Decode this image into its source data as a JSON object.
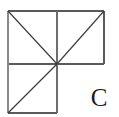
{
  "figure": {
    "label": "C",
    "background_color": "#ffffff",
    "stroke_color": "#5a5a5a",
    "label_color": "#1a1a1a",
    "stroke_width": 1,
    "geometry": {
      "outer_left": 8,
      "outer_top": 11,
      "outer_right": 104,
      "outer_bottom": 113,
      "mid_x": 57,
      "mid_y": 64,
      "cell_size": 49
    },
    "segments": [
      {
        "name": "top-edge",
        "x1": 8,
        "y1": 11,
        "x2": 104,
        "y2": 11
      },
      {
        "name": "middle-horizontal-edge",
        "x1": 8,
        "y1": 64,
        "x2": 104,
        "y2": 64
      },
      {
        "name": "bottom-edge",
        "x1": 8,
        "y1": 113,
        "x2": 57,
        "y2": 113
      },
      {
        "name": "left-edge",
        "x1": 8,
        "y1": 11,
        "x2": 8,
        "y2": 113
      },
      {
        "name": "middle-vertical-edge",
        "x1": 57,
        "y1": 11,
        "x2": 57,
        "y2": 113
      },
      {
        "name": "right-edge",
        "x1": 104,
        "y1": 11,
        "x2": 104,
        "y2": 64
      },
      {
        "name": "diagonal-top-left-square",
        "x1": 8,
        "y1": 11,
        "x2": 57,
        "y2": 64
      },
      {
        "name": "diagonal-top-right-square",
        "x1": 57,
        "y1": 64,
        "x2": 104,
        "y2": 11
      },
      {
        "name": "diagonal-bottom-left-square",
        "x1": 8,
        "y1": 113,
        "x2": 57,
        "y2": 64
      }
    ]
  }
}
